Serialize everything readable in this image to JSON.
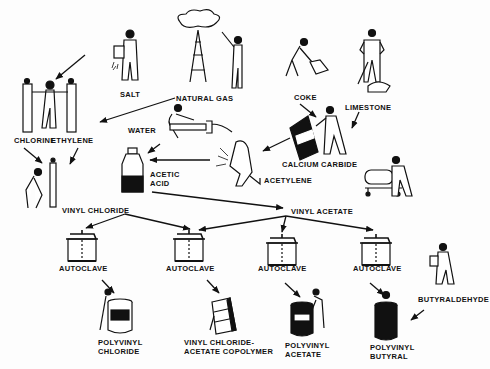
{
  "diagram": {
    "labels": {
      "salt": "SALT",
      "natural_gas": "NATURAL GAS",
      "coke": "COKE",
      "limestone": "LIMESTONE",
      "chlorine": "CHLORINE",
      "ethylene": "ETHYLENE",
      "water": "WATER",
      "calcium_carbide": "CALCIUM CARBIDE",
      "acetic_acid_1": "ACETIC",
      "acetic_acid_2": "ACID",
      "acetylene": "ACETYLENE",
      "vinyl_chloride": "VINYL CHLORIDE",
      "vinyl_acetate": "VINYL ACETATE",
      "autoclave_1": "AUTOCLAVE",
      "autoclave_2": "AUTOCLAVE",
      "autoclave_3": "AUTOCLAVE",
      "autoclave_4": "AUTOCLAVE",
      "butyraldehyde": "BUTYRALDEHYDE",
      "pvc_1": "POLYVINYL",
      "pvc_2": "CHLORIDE",
      "copolymer_1": "VINYL CHLORIDE-",
      "copolymer_2": "ACETATE COPOLYMER",
      "pva_1": "POLYVINYL",
      "pva_2": "ACETATE",
      "pvb_1": "POLYVINYL",
      "pvb_2": "BUTYRAL"
    },
    "nodes": [
      "salt",
      "natural-gas",
      "coke",
      "limestone",
      "chlorine",
      "ethylene",
      "water",
      "calcium-carbide",
      "acetic-acid",
      "acetylene",
      "vinyl-chloride",
      "vinyl-acetate",
      "autoclave-1",
      "autoclave-2",
      "autoclave-3",
      "autoclave-4",
      "butyraldehyde",
      "polyvinyl-chloride",
      "vinyl-chloride-acetate-copolymer",
      "polyvinyl-acetate",
      "polyvinyl-butyral"
    ],
    "edges": [
      [
        "salt",
        "chlorine"
      ],
      [
        "natural-gas",
        "ethylene"
      ],
      [
        "chlorine",
        "vinyl-chloride"
      ],
      [
        "ethylene",
        "vinyl-chloride"
      ],
      [
        "coke",
        "calcium-carbide"
      ],
      [
        "limestone",
        "calcium-carbide"
      ],
      [
        "calcium-carbide",
        "acetylene"
      ],
      [
        "water",
        "acetic-acid"
      ],
      [
        "acetylene",
        "acetic-acid"
      ],
      [
        "acetic-acid",
        "vinyl-acetate"
      ],
      [
        "vinyl-chloride",
        "autoclave-1"
      ],
      [
        "vinyl-chloride",
        "autoclave-2"
      ],
      [
        "vinyl-acetate",
        "autoclave-2"
      ],
      [
        "vinyl-acetate",
        "autoclave-3"
      ],
      [
        "vinyl-acetate",
        "autoclave-4"
      ],
      [
        "autoclave-1",
        "polyvinyl-chloride"
      ],
      [
        "autoclave-2",
        "vinyl-chloride-acetate-copolymer"
      ],
      [
        "autoclave-3",
        "polyvinyl-acetate"
      ],
      [
        "autoclave-4",
        "polyvinyl-butyral"
      ],
      [
        "butyraldehyde",
        "polyvinyl-butyral"
      ]
    ]
  }
}
